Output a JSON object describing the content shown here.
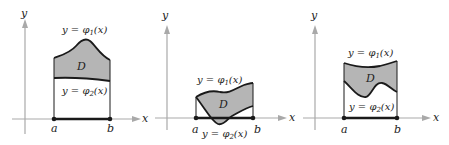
{
  "figure": {
    "colors": {
      "region_fill": "#b5b5b5",
      "axis": "#a9a9a9",
      "curve": "#1a1a1a"
    },
    "panels": [
      {
        "id": "panel-1",
        "axis_x_label": "x",
        "axis_y_label": "y",
        "a_label": "a",
        "b_label": "b",
        "region_label": "D",
        "upper_curve_label": {
          "prefix": "y = φ",
          "sub": "1",
          "suffix": "(x)"
        },
        "lower_curve_label": {
          "prefix": "y = φ",
          "sub": "2",
          "suffix": "(x)"
        }
      },
      {
        "id": "panel-2",
        "axis_x_label": "x",
        "axis_y_label": "y",
        "a_label": "a",
        "b_label": "b",
        "region_label": "D",
        "upper_curve_label": {
          "prefix": "y = φ",
          "sub": "1",
          "suffix": "(x)"
        },
        "lower_curve_label": {
          "prefix": "y = φ",
          "sub": "2",
          "suffix": "(x)"
        }
      },
      {
        "id": "panel-3",
        "axis_x_label": "x",
        "axis_y_label": "y",
        "a_label": "a",
        "b_label": "b",
        "region_label": "D",
        "upper_curve_label": {
          "prefix": "y = φ",
          "sub": "1",
          "suffix": "(x)"
        },
        "lower_curve_label": {
          "prefix": "y = φ",
          "sub": "2",
          "suffix": "(x)"
        }
      }
    ]
  }
}
